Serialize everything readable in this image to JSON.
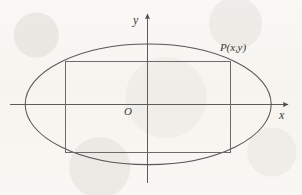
{
  "figure": {
    "kind": "coordinate-geometry-diagram",
    "background_color": "#f7f6f2",
    "stroke_color": "#555555",
    "text_color": "#3a3a3a"
  },
  "labels": {
    "y_axis": "y",
    "x_axis": "x",
    "origin": "O",
    "point_p": "P(x,y)"
  },
  "chart_data": {
    "type": "scatter",
    "title": "",
    "subtitle": "",
    "xlabel": "x",
    "ylabel": "y",
    "grid": false,
    "legend": null,
    "axes": {
      "origin_px": [
        147,
        104
      ],
      "x_axis_span_px": [
        10,
        290
      ],
      "y_axis_span_px": [
        183,
        12
      ],
      "x_arrow": true,
      "y_arrow": true,
      "ticks": [],
      "tick_labels": []
    },
    "shapes": [
      {
        "name": "ellipse",
        "type": "ellipse",
        "center_px": [
          148,
          104
        ],
        "semi_axis_x_px": 123,
        "semi_axis_y_px": 60,
        "filled": false,
        "stroke": "#555555"
      },
      {
        "name": "inscribed-rectangle",
        "type": "rect",
        "x_px": 65,
        "y_px": 61,
        "width_px": 165,
        "height_px": 91,
        "filled": false,
        "stroke": "#6b6b6b"
      }
    ],
    "annotations": [
      {
        "name": "point-p",
        "text": "P(x,y)",
        "at_px": [
          230,
          61
        ],
        "label_px": [
          220,
          42
        ],
        "note": "Upper-right vertex of the rectangle, lying on the ellipse"
      },
      {
        "name": "origin",
        "text": "O",
        "at_px": [
          147,
          104
        ],
        "label_px": [
          124,
          106
        ]
      }
    ]
  }
}
